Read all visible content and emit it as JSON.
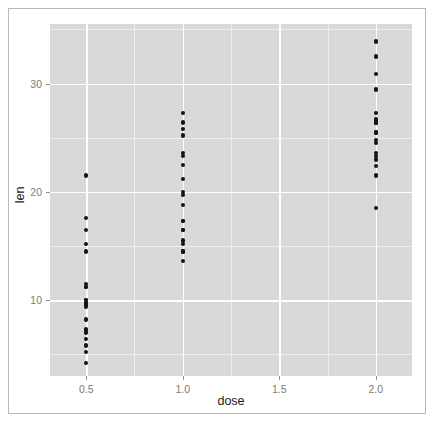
{
  "chart_data": {
    "type": "scatter",
    "title": "",
    "xlabel": "dose",
    "ylabel": "len",
    "xlim": [
      0.3125,
      2.1875
    ],
    "ylim": [
      3.0,
      35.5
    ],
    "xticks": [
      0.5,
      1.0,
      1.5,
      2.0
    ],
    "xtick_labels": [
      "0.5",
      "1.0",
      "1.5",
      "2.0"
    ],
    "yticks": [
      10,
      20,
      30
    ],
    "ytick_labels": [
      "10",
      "20",
      "30"
    ],
    "x_minor_ticks": [
      0.75,
      1.25,
      1.75
    ],
    "y_minor_ticks": [
      5,
      15,
      25,
      35
    ],
    "grid": true,
    "legend": "none",
    "panel_background": "#d9d9d9",
    "grid_color": "#ffffff",
    "point_color": "#141414",
    "series": [
      {
        "name": "ToothGrowth",
        "x": [
          0.5,
          0.5,
          0.5,
          0.5,
          0.5,
          0.5,
          0.5,
          0.5,
          0.5,
          0.5,
          0.5,
          0.5,
          0.5,
          0.5,
          0.5,
          0.5,
          0.5,
          0.5,
          0.5,
          0.5,
          1.0,
          1.0,
          1.0,
          1.0,
          1.0,
          1.0,
          1.0,
          1.0,
          1.0,
          1.0,
          1.0,
          1.0,
          1.0,
          1.0,
          1.0,
          1.0,
          1.0,
          1.0,
          1.0,
          1.0,
          2.0,
          2.0,
          2.0,
          2.0,
          2.0,
          2.0,
          2.0,
          2.0,
          2.0,
          2.0,
          2.0,
          2.0,
          2.0,
          2.0,
          2.0,
          2.0,
          2.0,
          2.0,
          2.0,
          2.0
        ],
        "y": [
          4.2,
          11.5,
          7.3,
          5.8,
          6.4,
          10.0,
          11.2,
          11.2,
          5.2,
          7.0,
          15.2,
          21.5,
          17.6,
          9.7,
          14.5,
          10.0,
          8.2,
          9.4,
          16.5,
          9.7,
          16.5,
          16.5,
          15.2,
          17.3,
          22.5,
          17.3,
          13.6,
          14.5,
          18.8,
          15.5,
          19.7,
          23.3,
          23.6,
          26.4,
          20.0,
          25.2,
          25.8,
          21.2,
          14.5,
          27.3,
          23.6,
          18.5,
          33.9,
          25.5,
          26.4,
          32.5,
          26.7,
          21.5,
          23.3,
          29.5,
          25.5,
          26.4,
          22.4,
          24.5,
          24.8,
          30.9,
          26.4,
          27.3,
          29.4,
          23.0
        ]
      }
    ]
  }
}
